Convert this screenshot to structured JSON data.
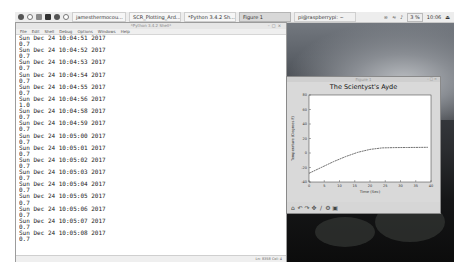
{
  "taskbar": {
    "launcher_icons": [
      "raspberry-menu-icon",
      "browser-icon",
      "file-manager-icon",
      "terminal-icon",
      "mathematica-icon",
      "wolfram-icon"
    ],
    "tasks": [
      {
        "label": "jamesthermocou...",
        "active": false
      },
      {
        "label": "SCR_Plotting_Ard...",
        "active": false
      },
      {
        "label": "*Python 3.4.2 Sh...",
        "active": false
      },
      {
        "label": "Figure 1",
        "active": true
      },
      {
        "label": "pi@raspberrypi: ~",
        "active": false
      }
    ],
    "tray": {
      "bluetooth": "bluetooth-icon",
      "network": "wifi-icon",
      "volume": "volume-icon",
      "cpu": "3 %",
      "clock": "10:06"
    }
  },
  "shell": {
    "title": "*Python 3.4.2 Shell*",
    "menu": [
      "File",
      "Edit",
      "Shell",
      "Debug",
      "Options",
      "Windows",
      "Help"
    ],
    "lines": [
      "Sun Dec 24 10:04:51 2017",
      "0.7",
      "Sun Dec 24 10:04:52 2017",
      "0.7",
      "Sun Dec 24 10:04:53 2017",
      "0.7",
      "Sun Dec 24 10:04:54 2017",
      "0.7",
      "Sun Dec 24 10:04:55 2017",
      "0.7",
      "Sun Dec 24 10:04:56 2017",
      "1.0",
      "Sun Dec 24 10:04:58 2017",
      "0.7",
      "Sun Dec 24 10:04:59 2017",
      "0.7",
      "Sun Dec 24 10:05:00 2017",
      "0.7",
      "Sun Dec 24 10:05:01 2017",
      "0.7",
      "Sun Dec 24 10:05:02 2017",
      "0.7",
      "Sun Dec 24 10:05:03 2017",
      "0.7",
      "Sun Dec 24 10:05:04 2017",
      "0.7",
      "Sun Dec 24 10:05:05 2017",
      "0.7",
      "Sun Dec 24 10:05:06 2017",
      "0.7",
      "Sun Dec 24 10:05:07 2017",
      "0.7",
      "Sun Dec 24 10:05:08 2017",
      "0.7"
    ],
    "status": "Ln: 8358 Col: 4"
  },
  "figure": {
    "window_title": "Figure 1",
    "plot_title": "The Scientyst's Ayde",
    "xlabel": "Time (Sec)",
    "ylabel": "Temperature (Degrees F)",
    "toolbar": [
      "home-icon",
      "back-icon",
      "forward-icon",
      "pan-icon",
      "zoom-icon",
      "configure-icon",
      "save-icon"
    ]
  },
  "chart_data": {
    "type": "line",
    "title": "The Scientyst's Ayde",
    "xlabel": "Time (Sec)",
    "ylabel": "Temperature (Degrees F)",
    "x_ticks": [
      "0",
      "5",
      "10",
      "15",
      "20",
      "25",
      "30",
      "35",
      "40"
    ],
    "y_ticks": [
      "80",
      "60",
      "40",
      "20",
      "0",
      "-20",
      "-40"
    ],
    "points": [
      [
        0,
        -28
      ],
      [
        4,
        -20
      ],
      [
        8,
        -12
      ],
      [
        12,
        -5
      ],
      [
        16,
        1
      ],
      [
        20,
        5
      ],
      [
        24,
        7
      ],
      [
        28,
        7.5
      ],
      [
        32,
        7.6
      ],
      [
        36,
        7.7
      ],
      [
        39,
        7.8
      ]
    ],
    "ylim": [
      -40,
      80
    ],
    "xlim": [
      0,
      40
    ],
    "grid": false,
    "line_color": "#333333"
  }
}
